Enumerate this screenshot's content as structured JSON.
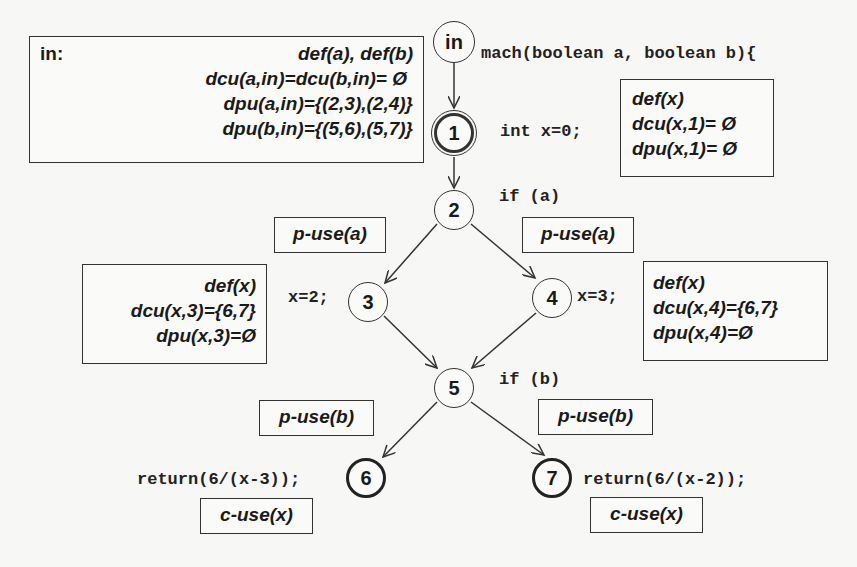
{
  "diagram": {
    "type": "control-flow-graph",
    "nodes": [
      {
        "id": "in",
        "label": "in",
        "code": "mach(boolean a, boolean b){"
      },
      {
        "id": "1",
        "label": "1",
        "code": "int x=0;"
      },
      {
        "id": "2",
        "label": "2",
        "code": "if (a)"
      },
      {
        "id": "3",
        "label": "3",
        "code": "x=2;"
      },
      {
        "id": "4",
        "label": "4",
        "code": "x=3;"
      },
      {
        "id": "5",
        "label": "5",
        "code": "if (b)"
      },
      {
        "id": "6",
        "label": "6",
        "code": "return(6/(x-3));"
      },
      {
        "id": "7",
        "label": "7",
        "code": "return(6/(x-2));"
      }
    ],
    "edges": [
      {
        "from": "in",
        "to": "1"
      },
      {
        "from": "1",
        "to": "2"
      },
      {
        "from": "2",
        "to": "3",
        "label": "p-use(a)"
      },
      {
        "from": "2",
        "to": "4",
        "label": "p-use(a)"
      },
      {
        "from": "3",
        "to": "5"
      },
      {
        "from": "4",
        "to": "5"
      },
      {
        "from": "5",
        "to": "6",
        "label": "p-use(b)"
      },
      {
        "from": "5",
        "to": "7",
        "label": "p-use(b)"
      }
    ]
  },
  "boxes": {
    "in_box": {
      "title": "in:",
      "lines": [
        "def(a), def(b)",
        "dcu(a,in)=dcu(b,in)= Ø",
        "dpu(a,in)={(2,3),(2,4)}",
        "dpu(b,in)={(5,6),(5,7)}"
      ]
    },
    "node1_box": {
      "lines": [
        "def(x)",
        "dcu(x,1)= Ø",
        "dpu(x,1)= Ø"
      ]
    },
    "node3_box": {
      "lines": [
        "def(x)",
        "dcu(x,3)={6,7}",
        "dpu(x,3)=Ø"
      ]
    },
    "node4_box": {
      "lines": [
        "def(x)",
        "dcu(x,4)={6,7}",
        "dpu(x,4)=Ø"
      ]
    }
  },
  "edge_labels": {
    "e23": "p-use(a)",
    "e24": "p-use(a)",
    "e56": "p-use(b)",
    "e57": "p-use(b)"
  },
  "node_labels": {
    "c6": "c-use(x)",
    "c7": "c-use(x)"
  }
}
